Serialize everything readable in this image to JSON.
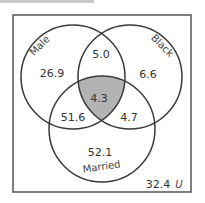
{
  "diagram": {
    "type": "venn",
    "sets": [
      {
        "label": "Male"
      },
      {
        "label": "Black"
      },
      {
        "label": "Married"
      }
    ],
    "universe_label": "U",
    "regions": {
      "male_only": "26.9",
      "black_only": "6.6",
      "married_only": "52.1",
      "male_black_only": "5.0",
      "male_married_only": "51.6",
      "black_married_only": "4.7",
      "male_black_married": "4.3",
      "outside": "32.4"
    },
    "highlighted_region": "male_black_married",
    "colors": {
      "stroke": "#3a3a3a",
      "highlight": "#b3b3b3",
      "border": "#555555"
    }
  }
}
